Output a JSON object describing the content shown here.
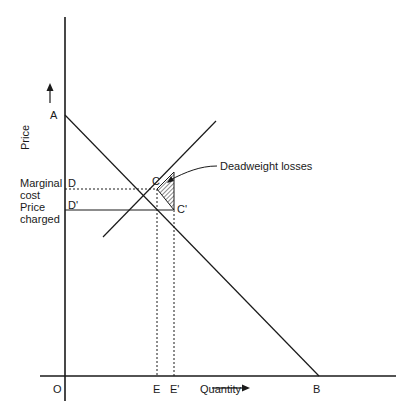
{
  "diagram": {
    "type": "economics-deadweight-loss",
    "axes": {
      "y_label": "Price",
      "x_label": "Quantity",
      "origin": "O"
    },
    "points": {
      "A": "A",
      "B": "B",
      "C": "C",
      "C_prime": "C'",
      "D": "D",
      "D_prime": "D'",
      "E": "E",
      "E_prime": "E'"
    },
    "left_labels": {
      "marginal_cost_line1": "Marginal",
      "marginal_cost_line2": "cost",
      "price_charged_line1": "Price",
      "price_charged_line2": "charged"
    },
    "annotation": "Deadweight losses",
    "colors": {
      "line": "#1a1a1a",
      "background": "#ffffff"
    }
  }
}
